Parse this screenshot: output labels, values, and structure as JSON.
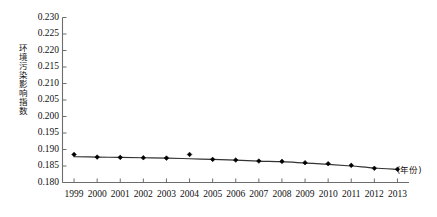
{
  "chart_data": {
    "type": "line",
    "title": "",
    "subtitle": "",
    "xlabel": "(年份)",
    "ylabel": "环境污染影响指数",
    "x": [
      1999,
      2000,
      2001,
      2002,
      2003,
      2004,
      2005,
      2006,
      2007,
      2008,
      2009,
      2010,
      2011,
      2012,
      2013
    ],
    "categories": [
      "1999",
      "2000",
      "2001",
      "2002",
      "2003",
      "2004",
      "2005",
      "2006",
      "2007",
      "2008",
      "2009",
      "2010",
      "2011",
      "2012",
      "2013"
    ],
    "values": [
      0.1885,
      0.1877,
      0.1876,
      0.1875,
      0.1874,
      0.1885,
      0.187,
      0.1868,
      0.1865,
      0.1864,
      0.186,
      0.1857,
      0.1852,
      0.1843,
      0.184
    ],
    "series": [
      {
        "name": "环境污染影响指数",
        "values": [
          0.1885,
          0.1877,
          0.1876,
          0.1875,
          0.1874,
          0.1885,
          0.187,
          0.1868,
          0.1865,
          0.1864,
          0.186,
          0.1857,
          0.1852,
          0.1843,
          0.184
        ],
        "marker": "diamond",
        "color": "#000000"
      }
    ],
    "trend_values": [
      0.1878,
      0.1877,
      0.1876,
      0.1875,
      0.1874,
      0.1872,
      0.187,
      0.1868,
      0.1865,
      0.1863,
      0.1859,
      0.1855,
      0.185,
      0.1844,
      0.184
    ],
    "ylim": [
      0.18,
      0.23
    ],
    "yticks": [
      0.18,
      0.185,
      0.19,
      0.195,
      0.2,
      0.205,
      0.21,
      0.215,
      0.22,
      0.225,
      0.23
    ],
    "ytick_labels": [
      "0.180",
      "0.185",
      "0.190",
      "0.195",
      "0.200",
      "0.205",
      "0.210",
      "0.215",
      "0.220",
      "0.225",
      "0.230"
    ],
    "xlim": [
      1998.5,
      2013.5
    ],
    "grid": false,
    "legend": null,
    "legend_position": "none",
    "annotations": [],
    "axis_color": "#6d6d6d",
    "line_color": "#333333",
    "marker_color": "#000000"
  },
  "axes": {
    "y_title": "环境污染影响指数",
    "x_unit_caption": "(年份)"
  }
}
